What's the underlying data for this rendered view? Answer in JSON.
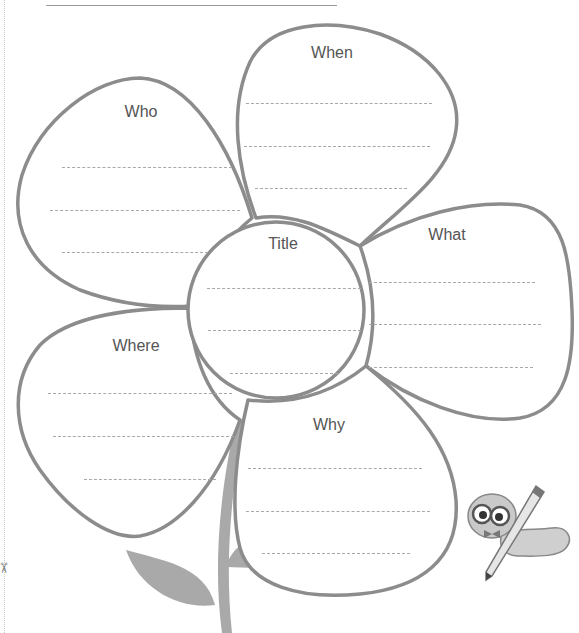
{
  "worksheet": {
    "title": "5W Flower Graphic Organizer",
    "stroke_color": "#8c8c8c",
    "stem_color": "#a9a9a9",
    "center": {
      "label": "Title",
      "line_count": 3
    },
    "petals": [
      {
        "id": "who",
        "label": "Who",
        "line_count": 3
      },
      {
        "id": "when",
        "label": "When",
        "line_count": 3
      },
      {
        "id": "what",
        "label": "What",
        "line_count": 3
      },
      {
        "id": "where",
        "label": "Where",
        "line_count": 3
      },
      {
        "id": "why",
        "label": "Why",
        "line_count": 3
      }
    ],
    "decorations": {
      "mascot": "bookworm-with-pencil-illustration",
      "cut_marker": "scissors-icon"
    }
  }
}
